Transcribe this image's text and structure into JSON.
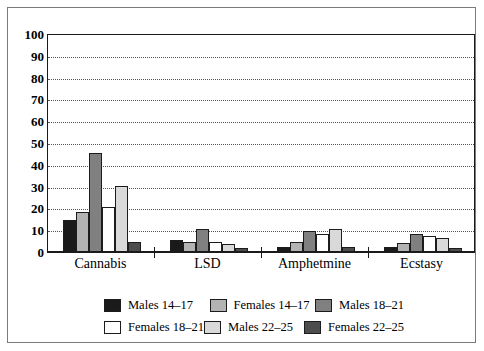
{
  "chart_data": {
    "type": "bar",
    "title": "",
    "xlabel": "",
    "ylabel": "",
    "ylim": [
      0,
      100
    ],
    "ytick_step": 10,
    "yticks": [
      "100",
      "90",
      "80",
      "70",
      "60",
      "50",
      "40",
      "30",
      "20",
      "10",
      "0"
    ],
    "grid": true,
    "legend_position": "bottom",
    "categories": [
      "Cannabis",
      "LSD",
      "Amphetmine",
      "Ecstasy"
    ],
    "series": [
      {
        "name": "Males 14–17",
        "color": "#1a1a1a",
        "values": [
          14,
          5,
          2,
          2
        ]
      },
      {
        "name": "Females 14–17",
        "color": "#b3b3b3",
        "values": [
          18,
          4,
          4,
          3.5
        ]
      },
      {
        "name": "Males 18–21",
        "color": "#808080",
        "values": [
          45,
          10,
          9,
          8
        ]
      },
      {
        "name": "Females 18–21",
        "color": "#ffffff",
        "values": [
          20,
          4,
          8,
          7
        ]
      },
      {
        "name": "Males 22–25",
        "color": "#d9d9d9",
        "values": [
          30,
          3,
          10,
          6
        ]
      },
      {
        "name": "Females 22–25",
        "color": "#4d4d4d",
        "values": [
          4,
          1.5,
          2,
          1.5
        ]
      }
    ]
  },
  "legend": {
    "rows": [
      [
        {
          "label": "Males 14–17",
          "color": "#1a1a1a"
        },
        {
          "label": "Females 14–17",
          "color": "#b3b3b3"
        },
        {
          "label": "Males 18–21",
          "color": "#808080"
        }
      ],
      [
        {
          "label": "Females 18–21",
          "color": "#ffffff"
        },
        {
          "label": "Males 22–25",
          "color": "#d9d9d9"
        },
        {
          "label": "Females 22–25",
          "color": "#4d4d4d"
        }
      ]
    ]
  }
}
